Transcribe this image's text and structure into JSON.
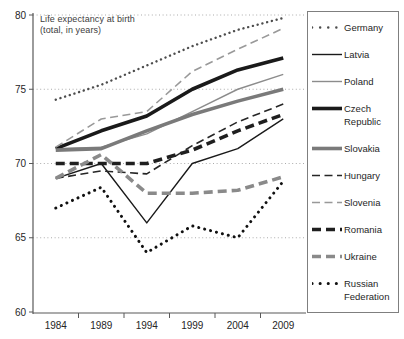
{
  "chart_data": {
    "type": "line",
    "title": "Life expectancy at birth (total, in years)",
    "title_lines": [
      "Life expectancy at birth",
      "(total, in years)"
    ],
    "xlabel": "",
    "ylabel": "",
    "categories": [
      "1984",
      "1989",
      "1994",
      "1999",
      "2004",
      "2009"
    ],
    "ylim": [
      60,
      80
    ],
    "yticks": [
      80,
      75,
      70,
      65,
      60
    ],
    "grid": "horizontal dotted gridlines at 65,70,75,80",
    "legend_position": "right",
    "axis_color": "#595959",
    "grid_color": "#ababab",
    "series": [
      {
        "name": "Germany",
        "values": [
          74.3,
          75.3,
          76.6,
          77.9,
          79.0,
          79.8
        ],
        "color": "#4d4d4d",
        "style": "dotted",
        "width": 2.4
      },
      {
        "name": "Latvia",
        "values": [
          69.0,
          70.0,
          66.0,
          70.0,
          71.0,
          73.0
        ],
        "color": "#1a1a1a",
        "style": "solid",
        "width": 1.4
      },
      {
        "name": "Poland",
        "values": [
          71.0,
          71.1,
          72.0,
          73.5,
          75.0,
          76.0
        ],
        "color": "#8c8c8c",
        "style": "solid",
        "width": 1.4
      },
      {
        "name": "Czech Republic",
        "values": [
          71.0,
          72.2,
          73.2,
          75.0,
          76.3,
          77.1
        ],
        "color": "#1a1a1a",
        "style": "solid",
        "width": 3.6
      },
      {
        "name": "Slovakia",
        "values": [
          70.9,
          71.0,
          72.2,
          73.3,
          74.2,
          75.0
        ],
        "color": "#7a7a7a",
        "style": "solid",
        "width": 3.6
      },
      {
        "name": "Hungary",
        "values": [
          69.0,
          69.5,
          69.3,
          71.2,
          72.8,
          74.0
        ],
        "color": "#262626",
        "style": "dashed",
        "width": 1.6
      },
      {
        "name": "Slovenia",
        "values": [
          71.1,
          73.0,
          73.5,
          76.2,
          77.7,
          79.1
        ],
        "color": "#999999",
        "style": "dashed",
        "width": 1.6
      },
      {
        "name": "Romania",
        "values": [
          70.0,
          70.0,
          70.0,
          70.9,
          72.2,
          73.3
        ],
        "color": "#1f1f1f",
        "style": "dashed",
        "width": 3.6
      },
      {
        "name": "Ukraine",
        "values": [
          69.0,
          70.6,
          68.0,
          68.0,
          68.2,
          69.1
        ],
        "color": "#8a8a8a",
        "style": "dashed",
        "width": 3.6
      },
      {
        "name": "Russian Federation",
        "values": [
          67.0,
          68.4,
          64.0,
          65.8,
          65.0,
          68.8
        ],
        "color": "#111111",
        "style": "dotted",
        "width": 3.0
      }
    ]
  }
}
